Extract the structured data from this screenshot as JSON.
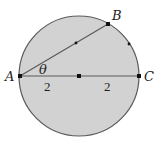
{
  "diagram": {
    "title": "",
    "colors": {
      "fill": "#d2d2d2",
      "stroke": "#5a5a5a",
      "point": "#111111",
      "text": "#222222"
    },
    "circle": {
      "cx": 79,
      "cy": 76,
      "r": 60
    },
    "points": [
      {
        "id": "A",
        "label": "A",
        "x": 20,
        "y": 76,
        "label_x": 5,
        "label_y": 81
      },
      {
        "id": "B",
        "label": "B",
        "x": 108,
        "y": 24,
        "label_x": 112,
        "label_y": 20
      },
      {
        "id": "C",
        "label": "C",
        "x": 139,
        "y": 76,
        "label_x": 144,
        "label_y": 81
      },
      {
        "id": "O",
        "label": "",
        "x": 79,
        "y": 76
      }
    ],
    "segments": [
      {
        "from": "A",
        "to": "B"
      },
      {
        "from": "A",
        "to": "C"
      }
    ],
    "angle_label": {
      "text": "θ",
      "x": 39,
      "y": 74
    },
    "length_labels": [
      {
        "text": "2",
        "x": 44,
        "y": 91
      },
      {
        "text": "2",
        "x": 104,
        "y": 91
      }
    ],
    "tick_marks": [
      {
        "on": "chord-AB-midpoint",
        "x": 76,
        "y": 43
      },
      {
        "on": "arc-BC",
        "x": 129,
        "y": 44
      }
    ]
  }
}
